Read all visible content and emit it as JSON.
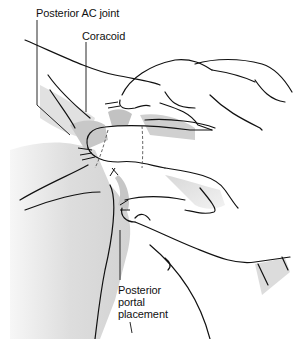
{
  "figure": {
    "type": "anatomical-illustration"
  },
  "labels": {
    "posterior_ac_joint": "Posterior AC joint",
    "coracoid": "Coracoid",
    "posterior_portal_line1": "Posterior",
    "posterior_portal_line2": "portal",
    "posterior_portal_line3": "placement"
  },
  "colors": {
    "line": "#111111",
    "shade_light": "#e6e6e6",
    "shade_mid": "#cfcfcf",
    "shade_dark": "#b9b9b9",
    "background": "#ffffff"
  }
}
